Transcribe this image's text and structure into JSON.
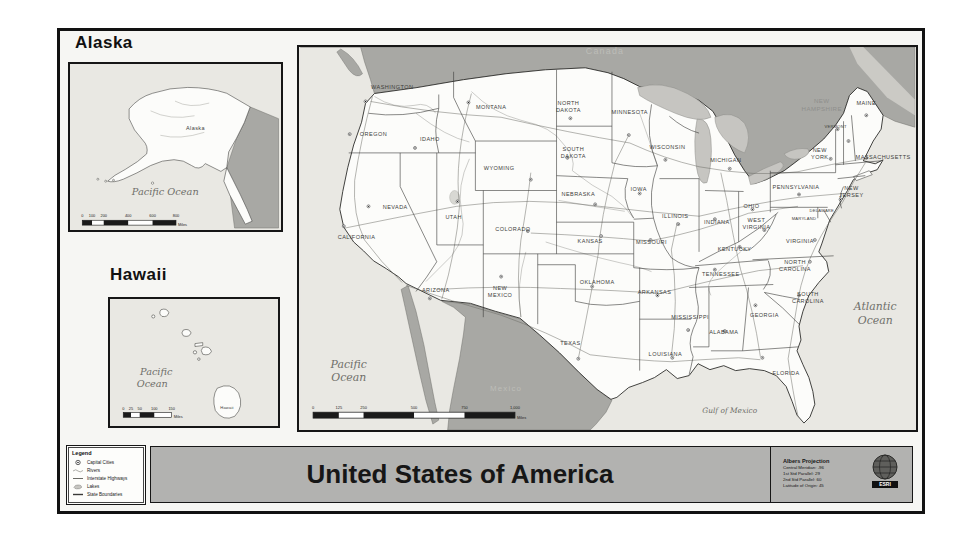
{
  "insets": {
    "alaska": {
      "title": "Alaska",
      "state_label": "Alaska",
      "ocean_label": "Pacific Ocean",
      "scale": {
        "ticks": [
          "0",
          "100",
          "200",
          "400",
          "600",
          "800"
        ],
        "unit": "Miles"
      }
    },
    "hawaii": {
      "title": "Hawaii",
      "state_label": "Hawaii",
      "ocean": {
        "line1": "Pacific",
        "line2": "Ocean"
      },
      "scale": {
        "ticks": [
          "0",
          "25",
          "50",
          "100",
          "150"
        ],
        "unit": "Miles"
      }
    }
  },
  "main_map": {
    "neighbors": {
      "canada": "Canada",
      "mexico": "Mexico"
    },
    "oceans": {
      "pacific1": "Pacific",
      "pacific2": "Ocean",
      "atlantic1": "Atlantic",
      "atlantic2": "Ocean",
      "gulf": "Gulf of Mexico"
    },
    "scale": {
      "ticks": [
        "0",
        "125",
        "250",
        "500",
        "750",
        "1,000"
      ],
      "unit": "Miles"
    },
    "states": [
      {
        "name": "Washington",
        "lines": [
          "WASHINGTON"
        ]
      },
      {
        "name": "Oregon",
        "lines": [
          "OREGON"
        ]
      },
      {
        "name": "California",
        "lines": [
          "CALIFORNIA"
        ]
      },
      {
        "name": "Nevada",
        "lines": [
          "NEVADA"
        ]
      },
      {
        "name": "Idaho",
        "lines": [
          "IDAHO"
        ]
      },
      {
        "name": "Montana",
        "lines": [
          "MONTANA"
        ]
      },
      {
        "name": "Wyoming",
        "lines": [
          "WYOMING"
        ]
      },
      {
        "name": "Utah",
        "lines": [
          "UTAH"
        ]
      },
      {
        "name": "Arizona",
        "lines": [
          "ARIZONA"
        ]
      },
      {
        "name": "New Mexico",
        "lines": [
          "NEW",
          "MEXICO"
        ]
      },
      {
        "name": "Colorado",
        "lines": [
          "COLORADO"
        ]
      },
      {
        "name": "North Dakota",
        "lines": [
          "NORTH",
          "DAKOTA"
        ]
      },
      {
        "name": "South Dakota",
        "lines": [
          "SOUTH",
          "DAKOTA"
        ]
      },
      {
        "name": "Nebraska",
        "lines": [
          "NEBRASKA"
        ]
      },
      {
        "name": "Kansas",
        "lines": [
          "KANSAS"
        ]
      },
      {
        "name": "Oklahoma",
        "lines": [
          "OKLAHOMA"
        ]
      },
      {
        "name": "Texas",
        "lines": [
          "TEXAS"
        ]
      },
      {
        "name": "Minnesota",
        "lines": [
          "MINNESOTA"
        ]
      },
      {
        "name": "Iowa",
        "lines": [
          "IOWA"
        ]
      },
      {
        "name": "Missouri",
        "lines": [
          "MISSOURI"
        ]
      },
      {
        "name": "Arkansas",
        "lines": [
          "ARKANSAS"
        ]
      },
      {
        "name": "Louisiana",
        "lines": [
          "LOUISIANA"
        ]
      },
      {
        "name": "Wisconsin",
        "lines": [
          "WISCONSIN"
        ]
      },
      {
        "name": "Illinois",
        "lines": [
          "ILLINOIS"
        ]
      },
      {
        "name": "Michigan",
        "lines": [
          "MICHIGAN"
        ]
      },
      {
        "name": "Indiana",
        "lines": [
          "INDIANA"
        ]
      },
      {
        "name": "Ohio",
        "lines": [
          "OHIO"
        ]
      },
      {
        "name": "Kentucky",
        "lines": [
          "KENTUCKY"
        ]
      },
      {
        "name": "Tennessee",
        "lines": [
          "TENNESSEE"
        ]
      },
      {
        "name": "Mississippi",
        "lines": [
          "MISSISSIPPI"
        ]
      },
      {
        "name": "Alabama",
        "lines": [
          "ALABAMA"
        ]
      },
      {
        "name": "Georgia",
        "lines": [
          "GEORGIA"
        ]
      },
      {
        "name": "Florida",
        "lines": [
          "FLORIDA"
        ]
      },
      {
        "name": "West Virginia",
        "lines": [
          "WEST",
          "VIRGINIA"
        ]
      },
      {
        "name": "Virginia",
        "lines": [
          "VIRGINIA"
        ]
      },
      {
        "name": "North Carolina",
        "lines": [
          "NORTH",
          "CAROLINA"
        ]
      },
      {
        "name": "South Carolina",
        "lines": [
          "SOUTH",
          "CAROLINA"
        ]
      },
      {
        "name": "New York",
        "lines": [
          "NEW",
          "YORK"
        ]
      },
      {
        "name": "Pennsylvania",
        "lines": [
          "PENNSYLVANIA"
        ]
      },
      {
        "name": "New Jersey",
        "lines": [
          "NEW",
          "JERSEY"
        ]
      },
      {
        "name": "Vermont",
        "lines": [
          "VERMONT"
        ]
      },
      {
        "name": "New Hampshire",
        "lines": [
          "NEW",
          "HAMPSHIRE"
        ]
      },
      {
        "name": "Maine",
        "lines": [
          "MAINE"
        ]
      },
      {
        "name": "Massachusetts",
        "lines": [
          "MASSACHUSETTS"
        ]
      },
      {
        "name": "Maryland",
        "lines": [
          "MARYLAND"
        ]
      },
      {
        "name": "Delaware",
        "lines": [
          "DELAWARE"
        ]
      }
    ]
  },
  "footer": {
    "legend": {
      "title": "Legend",
      "items": [
        {
          "label": "Capital Cities",
          "symbol": "capital-city-symbol"
        },
        {
          "label": "Rivers",
          "symbol": "river-line"
        },
        {
          "label": "Interstate Highways",
          "symbol": "highway-line"
        },
        {
          "label": "Lakes",
          "symbol": "lake-polygon"
        },
        {
          "label": "State Boundaries",
          "symbol": "boundary-line"
        }
      ]
    },
    "title": "United States of America",
    "projection": {
      "title": "Albers Projection",
      "lines": [
        "Central Meridian: -96",
        "1st Std Parallel: 29",
        "2nd Std Parallel: 60",
        "Latitude of Origin: 45"
      ]
    },
    "logo_text": "ESRI"
  },
  "colors": {
    "ocean": "#e9e8e3",
    "us_land": "#fcfcfa",
    "neighbor_land": "#a8a8a4",
    "lakes": "#c6c5c1",
    "title_band": "#b2b2b0",
    "frame_border": "#121212"
  }
}
